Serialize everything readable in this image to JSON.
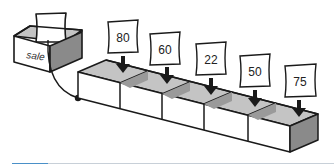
{
  "diagram": {
    "variable_label": "sale",
    "array_values": [
      "80",
      "60",
      "22",
      "50",
      "75"
    ],
    "colors": {
      "stroke": "#1a1a1a",
      "side_shade": "#8a8a8a",
      "inner_shade": "#c4c4c4",
      "face": "#ffffff",
      "rule_accent": "#4a90c8",
      "rule": "#c8d0d8"
    }
  }
}
